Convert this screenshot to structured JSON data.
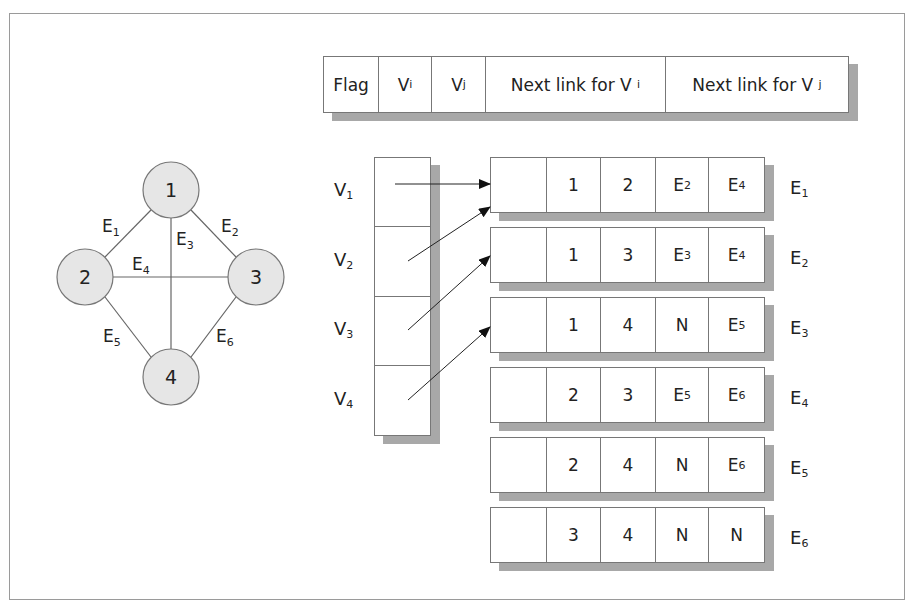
{
  "header_record": {
    "fields": [
      {
        "main": "Flag",
        "sub": ""
      },
      {
        "main": "V",
        "sub": "i"
      },
      {
        "main": "V",
        "sub": "j"
      },
      {
        "main": "Next link for V",
        "sub": "i"
      },
      {
        "main": "Next link for V",
        "sub": "j"
      }
    ]
  },
  "graph": {
    "nodes": [
      {
        "id": "1",
        "label": "1"
      },
      {
        "id": "2",
        "label": "2"
      },
      {
        "id": "3",
        "label": "3"
      },
      {
        "id": "4",
        "label": "4"
      }
    ],
    "edges": [
      {
        "name": "E",
        "sub": "1",
        "from": "1",
        "to": "2"
      },
      {
        "name": "E",
        "sub": "2",
        "from": "1",
        "to": "3"
      },
      {
        "name": "E",
        "sub": "3",
        "from": "1",
        "to": "4"
      },
      {
        "name": "E",
        "sub": "4",
        "from": "2",
        "to": "3"
      },
      {
        "name": "E",
        "sub": "5",
        "from": "2",
        "to": "4"
      },
      {
        "name": "E",
        "sub": "6",
        "from": "3",
        "to": "4"
      }
    ],
    "node_fill": "#e6e6e6",
    "line_color": "#666666"
  },
  "vertex_table": {
    "rows": [
      {
        "main": "V",
        "sub": "1"
      },
      {
        "main": "V",
        "sub": "2"
      },
      {
        "main": "V",
        "sub": "3"
      },
      {
        "main": "V",
        "sub": "4"
      }
    ]
  },
  "edge_records": [
    {
      "label": {
        "main": "E",
        "sub": "1"
      },
      "cells": [
        {
          "m": "",
          "s": ""
        },
        {
          "m": "1",
          "s": ""
        },
        {
          "m": "2",
          "s": ""
        },
        {
          "m": "E",
          "s": "2"
        },
        {
          "m": "E",
          "s": "4"
        }
      ]
    },
    {
      "label": {
        "main": "E",
        "sub": "2"
      },
      "cells": [
        {
          "m": "",
          "s": ""
        },
        {
          "m": "1",
          "s": ""
        },
        {
          "m": "3",
          "s": ""
        },
        {
          "m": "E",
          "s": "3"
        },
        {
          "m": "E",
          "s": "4"
        }
      ]
    },
    {
      "label": {
        "main": "E",
        "sub": "3"
      },
      "cells": [
        {
          "m": "",
          "s": ""
        },
        {
          "m": "1",
          "s": ""
        },
        {
          "m": "4",
          "s": ""
        },
        {
          "m": "N",
          "s": ""
        },
        {
          "m": "E",
          "s": "5"
        }
      ]
    },
    {
      "label": {
        "main": "E",
        "sub": "4"
      },
      "cells": [
        {
          "m": "",
          "s": ""
        },
        {
          "m": "2",
          "s": ""
        },
        {
          "m": "3",
          "s": ""
        },
        {
          "m": "E",
          "s": "5"
        },
        {
          "m": "E",
          "s": "6"
        }
      ]
    },
    {
      "label": {
        "main": "E",
        "sub": "5"
      },
      "cells": [
        {
          "m": "",
          "s": ""
        },
        {
          "m": "2",
          "s": ""
        },
        {
          "m": "4",
          "s": ""
        },
        {
          "m": "N",
          "s": ""
        },
        {
          "m": "E",
          "s": "6"
        }
      ]
    },
    {
      "label": {
        "main": "E",
        "sub": "6"
      },
      "cells": [
        {
          "m": "",
          "s": ""
        },
        {
          "m": "3",
          "s": ""
        },
        {
          "m": "4",
          "s": ""
        },
        {
          "m": "N",
          "s": ""
        },
        {
          "m": "N",
          "s": ""
        }
      ]
    }
  ]
}
